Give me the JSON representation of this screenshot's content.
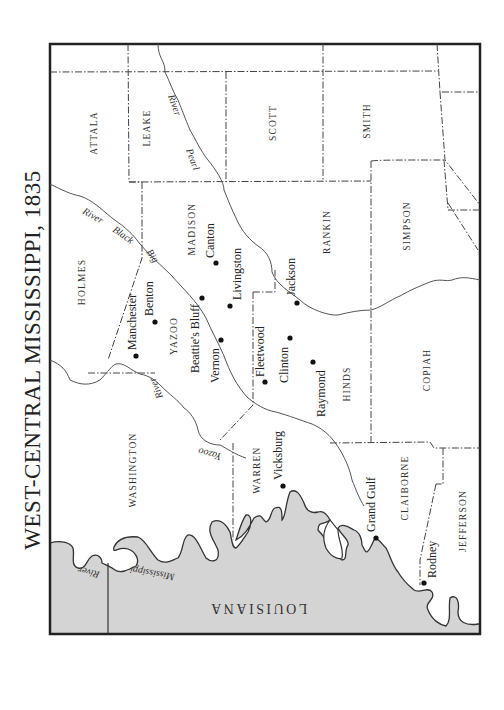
{
  "map": {
    "title": "WEST-CENTRAL MISSISSIPPI, 1835",
    "colors": {
      "land": "#ffffff",
      "louisiana": "#d4d4d4",
      "border": "#222222",
      "river": "#555555",
      "county_line": "#444444"
    },
    "counties": [
      {
        "name": "ATTALA"
      },
      {
        "name": "LEAKE"
      },
      {
        "name": "SCOTT"
      },
      {
        "name": "SMITH"
      },
      {
        "name": "HOLMES"
      },
      {
        "name": "MADISON"
      },
      {
        "name": "RANKIN"
      },
      {
        "name": "SIMPSON"
      },
      {
        "name": "YAZOO"
      },
      {
        "name": "HINDS"
      },
      {
        "name": "COPIAH"
      },
      {
        "name": "WASHINGTON"
      },
      {
        "name": "WARREN"
      },
      {
        "name": "CLAIBORNE"
      },
      {
        "name": "JEFFERSON"
      }
    ],
    "towns": [
      {
        "name": "Canton"
      },
      {
        "name": "Livingston"
      },
      {
        "name": "Jackson"
      },
      {
        "name": "Benton"
      },
      {
        "name": "Manchester"
      },
      {
        "name": "Beattie's Bluff"
      },
      {
        "name": "Vernon"
      },
      {
        "name": "Fleetwood"
      },
      {
        "name": "Clinton"
      },
      {
        "name": "Raymond"
      },
      {
        "name": "Vicksburg"
      },
      {
        "name": "Grand Gulf"
      },
      {
        "name": "Rodney"
      }
    ],
    "rivers": {
      "pearl": [
        "Pearl",
        "River"
      ],
      "big_black": [
        "Big",
        "Black",
        "River"
      ],
      "yazoo": [
        "Yazoo",
        "River"
      ],
      "mississippi": [
        "Mississippi",
        "River"
      ]
    },
    "state": "LOUISIANA"
  }
}
